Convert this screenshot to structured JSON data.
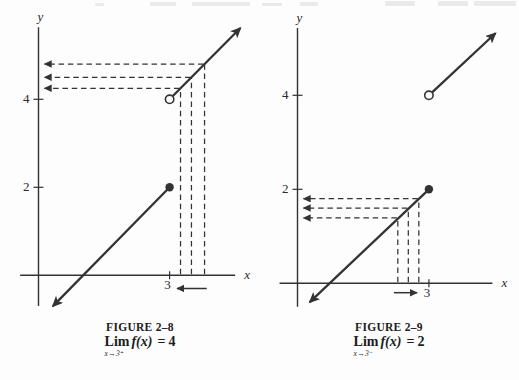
{
  "page": {
    "background": "#fdfdfd",
    "ink_color": "#333333"
  },
  "chart_data": [
    {
      "type": "line",
      "name": "figure-2-8",
      "title": "FIGURE 2–8",
      "xlabel": "x",
      "ylabel": "y",
      "xlim": [
        -0.42,
        4.5
      ],
      "ylim": [
        -0.7,
        5.64
      ],
      "grid": false,
      "x_ticks": [
        {
          "value": 3,
          "label": "3"
        }
      ],
      "y_ticks": [
        {
          "value": 2,
          "label": "2"
        },
        {
          "value": 4,
          "label": "4"
        }
      ],
      "segments": [
        {
          "name": "lower-branch",
          "from": [
            0.33,
            -0.7
          ],
          "to": [
            3,
            2
          ],
          "arrow_at": "from",
          "endpoint": {
            "x": 3,
            "y": 2,
            "style": "closed"
          }
        },
        {
          "name": "upper-branch",
          "from": [
            3,
            4
          ],
          "to": [
            4.62,
            5.62
          ],
          "arrow_at": "to",
          "endpoint": {
            "x": 3,
            "y": 4,
            "style": "open"
          }
        }
      ],
      "guide_points": [
        {
          "x": 3.8,
          "y": 4.8
        },
        {
          "x": 3.5,
          "y": 4.5
        },
        {
          "x": 3.25,
          "y": 4.25
        }
      ],
      "approach_arrow": {
        "from_x": 3.85,
        "to_x": 3.17,
        "y": -0.3
      },
      "caption": {
        "figure_label": "FIGURE 2–8",
        "lim": "Lim",
        "func": "f(x)",
        "eq": "=",
        "value": "4",
        "subscript": "x→3⁺"
      }
    },
    {
      "type": "line",
      "name": "figure-2-9",
      "title": "FIGURE 2–9",
      "xlabel": "x",
      "ylabel": "y",
      "xlim": [
        -0.41,
        4.45
      ],
      "ylim": [
        -0.5,
        5.43
      ],
      "grid": false,
      "x_ticks": [
        {
          "value": 3,
          "label": "3"
        }
      ],
      "y_ticks": [
        {
          "value": 2,
          "label": "2"
        },
        {
          "value": 4,
          "label": "4"
        }
      ],
      "segments": [
        {
          "name": "lower-branch",
          "from": [
            0.28,
            -0.4
          ],
          "to": [
            3,
            2
          ],
          "arrow_at": "from",
          "endpoint": {
            "x": 3,
            "y": 2,
            "style": "closed"
          }
        },
        {
          "name": "upper-branch",
          "from": [
            3,
            4
          ],
          "to": [
            4.52,
            5.32
          ],
          "arrow_at": "to",
          "endpoint": {
            "x": 3,
            "y": 4,
            "style": "open"
          }
        }
      ],
      "guide_points": [
        {
          "x": 2.77,
          "y": 1.8
        },
        {
          "x": 2.53,
          "y": 1.6
        },
        {
          "x": 2.29,
          "y": 1.39
        }
      ],
      "approach_arrow": {
        "from_x": 2.2,
        "to_x": 2.73,
        "y": -0.2
      },
      "caption": {
        "figure_label": "FIGURE 2–9",
        "lim": "Lim",
        "func": "f(x)",
        "eq": "=",
        "value": "2",
        "subscript": "x→3⁻"
      }
    }
  ]
}
